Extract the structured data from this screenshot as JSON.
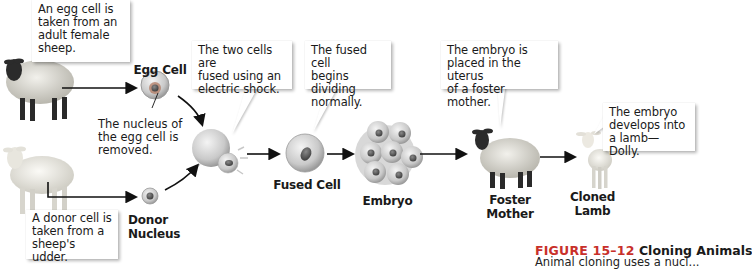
{
  "diagram": {
    "type": "process-flow",
    "topic": "Animal cloning of Dolly the sheep",
    "callouts": {
      "egg_source": "An egg cell is\ntaken from an\nadult female\nsheep.",
      "nucleus_removed": "The nucleus of\nthe egg cell is\nremoved.",
      "donor_source": "A donor cell is\ntaken from a\nsheep's udder.",
      "fusion": "The two cells are\nfused using an\nelectric shock.",
      "dividing": "The fused cell\nbegins dividing\nnormally.",
      "implant": "The embryo is\nplaced in the uterus\nof a foster mother.",
      "develops": "The embryo\ndevelops into\na lamb—Dolly."
    },
    "labels": {
      "egg_cell": "Egg Cell",
      "donor_nucleus": "Donor\nNucleus",
      "fused_cell": "Fused Cell",
      "embryo": "Embryo",
      "foster_mother": "Foster\nMother",
      "cloned_lamb": "Cloned\nLamb"
    },
    "caption": {
      "figure_number": "FIGURE 15–12",
      "title": "Cloning Animals",
      "body_partial": "Animal cloning uses a nucl..."
    },
    "colors": {
      "figure_red": "#c8302a",
      "arrow": "#111111",
      "cell_fill": "#cfcfcf",
      "nucleus": "#5a5a5a"
    },
    "steps": [
      "Egg cell taken from adult female sheep",
      "Nucleus of egg cell removed",
      "Donor cell taken from sheep's udder",
      "Cells fused using electric shock",
      "Fused cell begins dividing",
      "Embryo placed in uterus of foster mother",
      "Embryo develops into lamb Dolly"
    ]
  }
}
